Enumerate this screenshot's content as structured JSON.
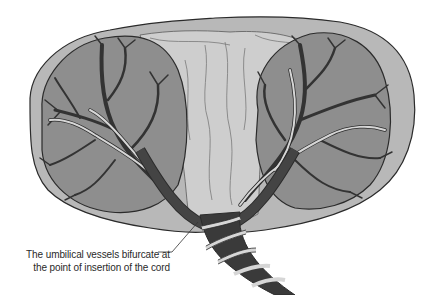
{
  "figure": {
    "colors": {
      "background": "#ffffff",
      "membrane_outer": "#b5b5b5",
      "membrane_center": "#cfcfcf",
      "lobe_fill": "#8e8e8e",
      "artery_dark": "#3a3a3a",
      "vein_light": "#d6d6d6",
      "outline": "#2b2b2b"
    }
  },
  "annotation": {
    "line1": "The umbilical vessels bifurcate at",
    "line2": "the point of insertion of the cord"
  }
}
